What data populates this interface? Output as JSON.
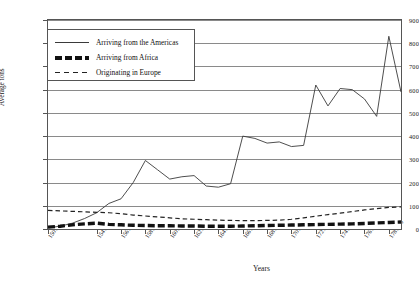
{
  "chart_data": {
    "type": "line",
    "title": "",
    "xlabel": "Years",
    "ylabel": "Average tons",
    "ylim": [
      0,
      900
    ],
    "ytick_values": [
      0,
      100,
      200,
      300,
      400,
      500,
      600,
      700,
      800,
      900
    ],
    "ytick_labels": [
      "0",
      "100",
      "200",
      "300",
      "400",
      "500",
      "600",
      "700",
      "800",
      "900"
    ],
    "grid": true,
    "legend_position": "upper-left-inside",
    "categories": [
      "1501-10",
      "1511-20",
      "1521-30",
      "1531-40",
      "1541-50",
      "1551-60",
      "1561-70",
      "1571-80",
      "1581-90",
      "1591-600",
      "1601-10",
      "1611-20",
      "1621-30",
      "1631-40",
      "1641-50",
      "1651-60",
      "1661-70",
      "1671-80",
      "1681-90",
      "1691-700",
      "1701-10",
      "1711-20",
      "1721-30",
      "1731-40",
      "1741-50",
      "1751-60",
      "1761-70",
      "1771-80",
      "1781-90",
      "1791-800"
    ],
    "xtick_labels_shown": [
      "1501-10",
      "1541-50",
      "1561-70",
      "1581-90",
      "1601-10",
      "1621-30",
      "1641-50",
      "1661-70",
      "1681-90",
      "1701-10",
      "1721-30",
      "1741-50",
      "1761-70",
      "1781-90"
    ],
    "series": [
      {
        "name": "Arriving from the Americas",
        "style": "thin-solid",
        "color": "#3a3a3a",
        "values": [
          5,
          12,
          25,
          45,
          70,
          110,
          130,
          200,
          295,
          255,
          215,
          225,
          230,
          185,
          180,
          195,
          400,
          390,
          370,
          375,
          355,
          360,
          620,
          530,
          605,
          600,
          560,
          485,
          830,
          590
        ]
      },
      {
        "name": "Arriving from Africa",
        "style": "thick-dashed",
        "color": "#111111",
        "values": [
          8,
          12,
          18,
          22,
          25,
          20,
          18,
          16,
          15,
          14,
          14,
          13,
          13,
          12,
          12,
          12,
          13,
          14,
          15,
          16,
          17,
          18,
          19,
          20,
          21,
          22,
          24,
          26,
          28,
          30
        ]
      },
      {
        "name": "Originating in Europe",
        "style": "thin-dashed",
        "color": "#222222",
        "values": [
          80,
          78,
          76,
          74,
          72,
          70,
          66,
          60,
          56,
          52,
          48,
          44,
          42,
          40,
          38,
          37,
          36,
          36,
          37,
          38,
          42,
          48,
          55,
          62,
          68,
          75,
          82,
          88,
          93,
          95
        ]
      }
    ]
  },
  "legend": {
    "items": [
      {
        "label": "Arriving from the Americas"
      },
      {
        "label": "Arriving from Africa"
      },
      {
        "label": "Originating in Europe"
      }
    ]
  }
}
